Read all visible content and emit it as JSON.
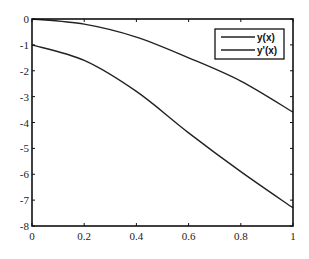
{
  "chart_data": {
    "type": "line",
    "title": "",
    "xlabel": "",
    "ylabel": "",
    "xlim": [
      0,
      1
    ],
    "ylim": [
      -8,
      0
    ],
    "grid": false,
    "legend_position": "upper right",
    "x_ticks": [
      "0",
      "0.2",
      "0.4",
      "0.6",
      "0.8",
      "1"
    ],
    "y_ticks": [
      "0",
      "-1",
      "-2",
      "-3",
      "-4",
      "-5",
      "-6",
      "-7",
      "-8"
    ],
    "x": [
      0,
      0.2,
      0.4,
      0.6,
      0.8,
      1.0
    ],
    "series": [
      {
        "name": "y(x)",
        "values": [
          0,
          -0.2,
          -0.7,
          -1.5,
          -2.4,
          -3.6
        ]
      },
      {
        "name": "y'(x)",
        "values": [
          -1.0,
          -1.6,
          -2.8,
          -4.4,
          -5.9,
          -7.3
        ]
      }
    ]
  },
  "legend": {
    "items": [
      "y(x)",
      "y'(x)"
    ]
  }
}
